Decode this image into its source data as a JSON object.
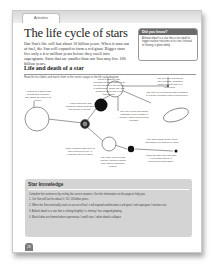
{
  "header": {
    "tab_label": "Activities"
  },
  "title": "The life cycle of stars",
  "intro": "Our Sun's life will last about 10 billion years. When it runs out of fuel, the Sun will expand to form a red giant. Bigger stars live only a few million years before they swell into supergiants. Stars that are smaller than our Sun may live 100 billion years.",
  "did_you_know": {
    "heading": "Did you know?",
    "body": "A brown dwarf is a star that is too small to trigger nuclear reactions in its core. Instead of shining, it glows dimly."
  },
  "section": {
    "heading": "Life and death of a star",
    "instructions": "Read the fact labels and match them to the correct stages in the life cycle diagram."
  },
  "diagram_labels": [
    "A nebula is a giant cloud of dust and hydrogen gas. Stars are born in its centre.",
    "When a massive star hundreds of times bigger than our Sun begins to use its fuel, it cools down, grows red, and begins to swell into a red supergiant.",
    "The core of a supernova may collapse, forming a dense neutron star or a black hole.",
    "A main sequence star shines by fusing hydrogen into helium in its core.",
    "The core of a supergiant star collapses in a huge explosion called a supernova.",
    "The core of the supergiant collapses; heavy matter is ejected, called a supernova remnant.",
    "When a smaller star like our Sun runs out of fuel, it expands into a red giant.",
    "The outer layers of gas drift off, leaving a bright core called a planetary nebula.",
    "The white dwarf slowly cools and fades over billions of years.",
    "When the star is so cool that it no longer shines, it becomes a black dwarf."
  ],
  "star_knowledge": {
    "heading": "Star knowledge",
    "instructions": "Complete the sentences by circling the correct answers. Use the information on this page to help you.",
    "items": [
      "1. Our Sun will last for about 5 / 10 / 20 billion years.",
      "2. When the Sun eventually starts to run out of fuel, it will expand and become a red giant / red supergiant / neutron star.",
      "3. A black dwarf is a star that is shining brightly / is shining / has stopped glowing.",
      "4. Black holes are formed when supernovas / small stars / white dwarfs collapse."
    ]
  },
  "footer": {
    "page_number": "28"
  },
  "colors": {
    "panel_grey": "#d4d4d4",
    "dark_badge": "#6a6a6a",
    "black_star": "#111111"
  }
}
